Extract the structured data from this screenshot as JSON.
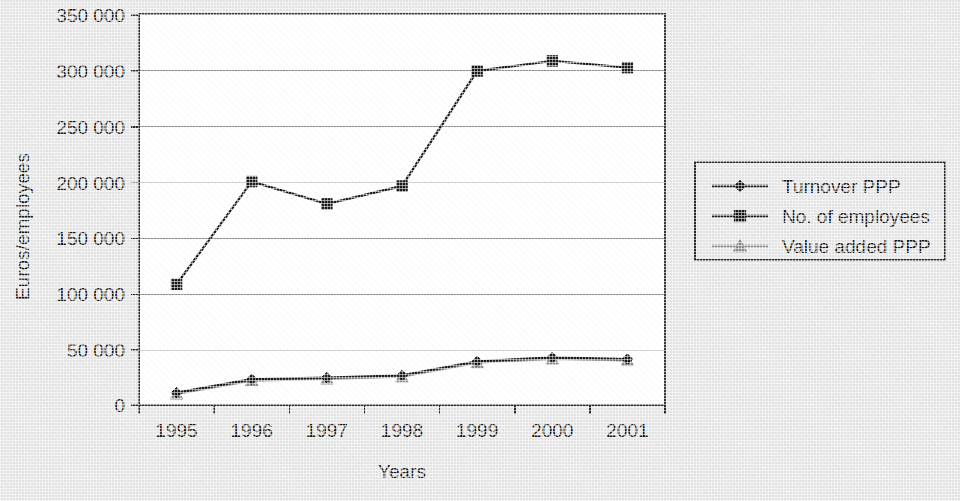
{
  "chart_data": {
    "type": "line",
    "title": "",
    "xlabel": "Years",
    "ylabel": "Euros/employees",
    "categories": [
      "1995",
      "1996",
      "1997",
      "1998",
      "1999",
      "2000",
      "2001"
    ],
    "ylim": [
      0,
      350000
    ],
    "ytick_step": 50000,
    "ytick_labels": [
      "0",
      "50 000",
      "100 000",
      "150 000",
      "200 000",
      "250 000",
      "300 000",
      "350 000"
    ],
    "ytick_values": [
      0,
      50000,
      100000,
      150000,
      200000,
      250000,
      300000,
      350000
    ],
    "grid": "horizontal",
    "legend_position": "right",
    "series": [
      {
        "name": "Turnover PPP",
        "marker": "diamond",
        "color": "#1a1a1a",
        "values": [
          11000,
          23000,
          24500,
          26500,
          39000,
          42500,
          41000
        ]
      },
      {
        "name": "No. of employees",
        "marker": "square",
        "color": "#1a1a1a",
        "values": [
          108000,
          200000,
          180000,
          196000,
          299000,
          308000,
          302000
        ]
      },
      {
        "name": "Value added PPP",
        "marker": "triangle",
        "color": "#8a8a8a",
        "values": [
          10000,
          22000,
          23500,
          25500,
          38000,
          41500,
          40000
        ]
      }
    ]
  },
  "colors": {
    "background": "#e4e4e4",
    "plot_background": "#ffffff",
    "gridline": "#8d8d8d",
    "axis": "#2b2b2b",
    "series_dark": "#1a1a1a",
    "series_gray": "#8a8a8a"
  }
}
